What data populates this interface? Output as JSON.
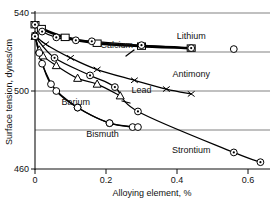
{
  "chart_data": {
    "type": "line",
    "title": "",
    "xlabel": "Alloying element, %",
    "ylabel": "Surface tension, dynes/cm",
    "xlim": [
      0,
      0.66
    ],
    "ylim": [
      460,
      542
    ],
    "xticks": [
      "0",
      "0.2",
      "0.4",
      "0.6"
    ],
    "xtick_values": [
      0,
      0.2,
      0.4,
      0.6
    ],
    "yticks": [
      "460",
      "500",
      "540"
    ],
    "ytick_values": [
      460,
      500,
      540
    ],
    "gridlines_y": [
      460,
      480,
      500,
      520,
      540
    ],
    "grid": true,
    "legend_position": "inline-labels",
    "series": [
      {
        "name": "Lithium",
        "label": "Lithium",
        "marker": "square",
        "points": [
          [
            0.0,
            534.0
          ],
          [
            0.018,
            532.0
          ],
          [
            0.085,
            527.5
          ],
          [
            0.175,
            524.5
          ],
          [
            0.3,
            523.0
          ],
          [
            0.44,
            522.0
          ]
        ]
      },
      {
        "name": "Calcium",
        "label": "Calcium",
        "marker": "circle-dot",
        "points": [
          [
            0.0,
            534.0
          ],
          [
            0.02,
            530.5
          ],
          [
            0.06,
            527.5
          ],
          [
            0.115,
            526.0
          ],
          [
            0.16,
            525.5
          ],
          [
            0.3,
            523.5
          ],
          [
            0.44,
            522.0
          ]
        ]
      },
      {
        "name": "Antimony",
        "label": "Antimony",
        "marker": "x",
        "points": [
          [
            0.0,
            528.5
          ],
          [
            0.03,
            524.0
          ],
          [
            0.1,
            517.0
          ],
          [
            0.175,
            511.0
          ],
          [
            0.28,
            505.5
          ],
          [
            0.37,
            501.0
          ],
          [
            0.44,
            498.5
          ]
        ]
      },
      {
        "name": "Lead",
        "label": "Lead",
        "marker": "triangle",
        "points": [
          [
            0.0,
            528.0
          ],
          [
            0.012,
            521.0
          ],
          [
            0.022,
            518.0
          ],
          [
            0.06,
            513.0
          ],
          [
            0.12,
            506.5
          ],
          [
            0.175,
            503.5
          ],
          [
            0.24,
            497.5
          ]
        ]
      },
      {
        "name": "Barium",
        "label": "Barium",
        "marker": "circle",
        "points": [
          [
            0.0,
            528.5
          ],
          [
            0.012,
            519.5
          ],
          [
            0.045,
            503.5
          ],
          [
            0.12,
            491.5
          ],
          [
            0.21,
            483.5
          ],
          [
            0.275,
            481.5
          ]
        ]
      },
      {
        "name": "Bismuth",
        "label": "Bismuth",
        "marker": "circle",
        "points": [
          [
            0.0,
            528.5
          ],
          [
            0.02,
            514.0
          ],
          [
            0.06,
            500.0
          ],
          [
            0.12,
            491.5
          ],
          [
            0.21,
            483.5
          ],
          [
            0.29,
            481.5
          ]
        ]
      },
      {
        "name": "Strontium",
        "label": "Strontium",
        "marker": "circle-dot",
        "points": [
          [
            0.0,
            528.0
          ],
          [
            0.055,
            517.0
          ],
          [
            0.155,
            508.0
          ],
          [
            0.225,
            502.0
          ],
          [
            0.29,
            489.5
          ],
          [
            0.56,
            468.5
          ],
          [
            0.635,
            463.5
          ]
        ]
      }
    ],
    "extra_points": [
      {
        "x": 0.56,
        "y": 521.5,
        "marker": "circle",
        "series": "Lithium"
      }
    ],
    "annotations": [
      {
        "text": "Lithium",
        "x": 0.44,
        "y": 525.0
      },
      {
        "text": "Calcium",
        "x": 0.23,
        "y": 520.5
      },
      {
        "text": "Antimony",
        "x": 0.44,
        "y": 505.5
      },
      {
        "text": "Lead",
        "x": 0.3,
        "y": 497.5
      },
      {
        "text": "Barium",
        "x": 0.115,
        "y": 491.5
      },
      {
        "text": "Bismuth",
        "x": 0.19,
        "y": 475.0
      },
      {
        "text": "Strontium",
        "x": 0.44,
        "y": 466.5
      }
    ]
  }
}
